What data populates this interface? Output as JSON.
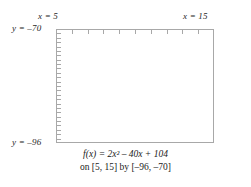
{
  "figure": {
    "background": "#ffffff",
    "frame_color": "#a8a8a8",
    "curve_color": "#3b3b3b",
    "text_color": "#1a1a1a"
  },
  "labels": {
    "x_left": "x = 5",
    "x_right": "x = 15",
    "y_top": "y = –70",
    "y_bottom": "y = –96"
  },
  "caption": {
    "line1": "f(x) = 2x² – 40x + 104",
    "line2": "on [5, 15] by [–96, –70]"
  },
  "chart_data": {
    "type": "line",
    "title": "",
    "subtitle": "",
    "xlabel": "x",
    "ylabel": "y",
    "function": "f(x) = 2x^2 - 40x + 104",
    "coefficients": {
      "a": 2,
      "b": -40,
      "c": 104
    },
    "vertex": {
      "x": 10,
      "y": -96
    },
    "xlim": [
      5,
      15
    ],
    "ylim": [
      -96,
      -70
    ],
    "xticks": [
      5,
      6,
      7,
      8,
      9,
      10,
      11,
      12,
      13,
      14,
      15
    ],
    "yticks": [
      -96,
      -95,
      -94,
      -93,
      -92,
      -91,
      -90,
      -89,
      -88,
      -87,
      -86,
      -85,
      -84,
      -83,
      -82,
      -81,
      -80,
      -79,
      -78,
      -77,
      -76,
      -75,
      -74,
      -73,
      -72,
      -71,
      -70
    ],
    "tick_labels_shown": false,
    "grid": false,
    "legend": false,
    "axis_note": "window frame drawn as rectangle; ticks on top and left edges only",
    "x": [
      5,
      5.25,
      5.5,
      5.75,
      6,
      6.25,
      6.5,
      6.75,
      7,
      7.25,
      7.5,
      7.75,
      8,
      8.25,
      8.5,
      8.75,
      9,
      9.25,
      9.5,
      9.75,
      10,
      10.25,
      10.5,
      10.75,
      11,
      11.25,
      11.5,
      11.75,
      12,
      12.25,
      12.5,
      12.75,
      13,
      13.25,
      13.5,
      13.75,
      14,
      14.25,
      14.5,
      14.75,
      15
    ],
    "y": [
      -46,
      -50.875,
      -55.5,
      -59.875,
      -64,
      -67.875,
      -71.5,
      -74.875,
      -78,
      -80.875,
      -83.5,
      -85.875,
      -88,
      -89.875,
      -91.5,
      -92.875,
      -94,
      -94.875,
      -95.5,
      -95.875,
      -96,
      -95.875,
      -95.5,
      -94.875,
      -94,
      -92.875,
      -91.5,
      -89.875,
      -88,
      -85.875,
      -83.5,
      -80.875,
      -78,
      -74.875,
      -71.5,
      -67.875,
      -64,
      -59.875,
      -55.5,
      -50.875,
      -46
    ],
    "series": [
      {
        "name": "f(x) = 2x^2 - 40x + 104",
        "color": "#3b3b3b",
        "values": [
          -46,
          -50.875,
          -55.5,
          -59.875,
          -64,
          -67.875,
          -71.5,
          -74.875,
          -78,
          -80.875,
          -83.5,
          -85.875,
          -88,
          -89.875,
          -91.5,
          -92.875,
          -94,
          -94.875,
          -95.5,
          -95.875,
          -96,
          -95.875,
          -95.5,
          -94.875,
          -94,
          -92.875,
          -91.5,
          -89.875,
          -88,
          -85.875,
          -83.5,
          -80.875,
          -78,
          -74.875,
          -71.5,
          -67.875,
          -64,
          -59.875,
          -55.5,
          -50.875,
          -46
        ]
      }
    ]
  }
}
